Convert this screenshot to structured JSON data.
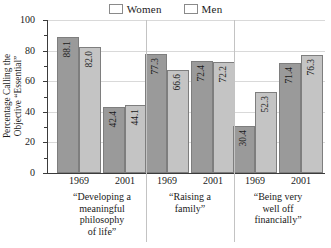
{
  "chart_data": {
    "type": "bar",
    "title": "",
    "subtitle": "",
    "xlabel": "",
    "ylabel": "Percentage Calling the Objective “Essential”",
    "ylabel_lines": [
      "Percentage Calling the",
      "Objective “Essential”"
    ],
    "ylim": [
      0,
      100
    ],
    "ytick_labels": [
      "100",
      "80",
      "60",
      "40",
      "20",
      "0"
    ],
    "ytick_values": [
      100,
      80,
      60,
      40,
      20,
      0
    ],
    "minor_tick_values": [
      90,
      70,
      50,
      30,
      10
    ],
    "grid": true,
    "legend_position": "top-center",
    "legend": [
      "Women",
      "Men"
    ],
    "series": [
      {
        "name": "Women",
        "color": "#9a9a9a",
        "values": [
          88.1,
          42.4,
          77.3,
          72.4,
          30.4,
          71.4
        ]
      },
      {
        "name": "Men",
        "color": "#c4c4c4",
        "values": [
          82.0,
          44.1,
          66.6,
          72.2,
          52.3,
          76.3
        ]
      }
    ],
    "x": [
      "1969",
      "2001",
      "1969",
      "2001",
      "1969",
      "2001"
    ],
    "groups": [
      {
        "caption_lines": [
          "“Developing a",
          "meaningful",
          "philosophy",
          "of life”"
        ],
        "caption": "“Developing a meaningful philosophy of life”",
        "years": [
          "1969",
          "2001"
        ]
      },
      {
        "caption_lines": [
          "“Raising a",
          "family”"
        ],
        "caption": "“Raising a family”",
        "years": [
          "1969",
          "2001"
        ]
      },
      {
        "caption_lines": [
          "“Being very",
          "well off",
          "financially”"
        ],
        "caption": "“Being very well off financially”",
        "years": [
          "1969",
          "2001"
        ]
      }
    ],
    "bars": [
      {
        "group": 0,
        "year": "1969",
        "series": "Women",
        "value": 88.1,
        "label": "88.1"
      },
      {
        "group": 0,
        "year": "1969",
        "series": "Men",
        "value": 82.0,
        "label": "82.0"
      },
      {
        "group": 0,
        "year": "2001",
        "series": "Women",
        "value": 42.4,
        "label": "42.4"
      },
      {
        "group": 0,
        "year": "2001",
        "series": "Men",
        "value": 44.1,
        "label": "44.1"
      },
      {
        "group": 1,
        "year": "1969",
        "series": "Women",
        "value": 77.3,
        "label": "77.3"
      },
      {
        "group": 1,
        "year": "1969",
        "series": "Men",
        "value": 66.6,
        "label": "66.6"
      },
      {
        "group": 1,
        "year": "2001",
        "series": "Women",
        "value": 72.4,
        "label": "72.4"
      },
      {
        "group": 1,
        "year": "2001",
        "series": "Men",
        "value": 72.2,
        "label": "72.2"
      },
      {
        "group": 2,
        "year": "1969",
        "series": "Women",
        "value": 30.4,
        "label": "30.4"
      },
      {
        "group": 2,
        "year": "1969",
        "series": "Men",
        "value": 52.3,
        "label": "52.3"
      },
      {
        "group": 2,
        "year": "2001",
        "series": "Women",
        "value": 71.4,
        "label": "71.4"
      },
      {
        "group": 2,
        "year": "2001",
        "series": "Men",
        "value": 76.3,
        "label": "76.3"
      }
    ],
    "colors": {
      "women": "#9a9a9a",
      "men": "#c4c4c4",
      "grid": "#d9d9d9",
      "axis": "#3b3b3b",
      "separator": "#c3c3c3",
      "background": "#ffffff",
      "text": "#1a1a1a"
    }
  }
}
